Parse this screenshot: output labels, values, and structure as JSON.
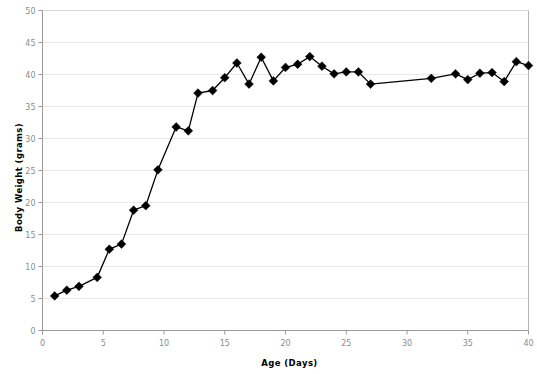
{
  "chart_data": {
    "type": "line",
    "title": "",
    "subtitle": "",
    "xlabel": "Age  (Days)",
    "ylabel": "Body Weight  (grams)",
    "xlim": [
      0,
      40
    ],
    "ylim": [
      0,
      50
    ],
    "xticks": [
      0,
      5,
      10,
      15,
      20,
      25,
      30,
      35,
      40
    ],
    "xtick_labels": [
      "0",
      "5",
      "10",
      "15",
      "20",
      "25",
      "30",
      "35",
      "40"
    ],
    "yticks": [
      0,
      5,
      10,
      15,
      20,
      25,
      30,
      35,
      40,
      45,
      50
    ],
    "ytick_labels": [
      "0",
      "5",
      "10",
      "15",
      "20",
      "25",
      "30",
      "35",
      "40",
      "45",
      "50"
    ],
    "grid": true,
    "grid_axis": "y",
    "grid_color": "#e8e8e8",
    "legend": false,
    "legend_position": "none",
    "marker": "diamond",
    "marker_color": "#000000",
    "line_color": "#000000",
    "line_width": 1.3,
    "marker_size": 4.4,
    "series": [
      {
        "name": "Body Weight",
        "x": [
          1,
          2,
          3,
          4.5,
          5.5,
          6.5,
          7.5,
          8.5,
          9.5,
          11,
          12,
          12.8,
          14,
          15,
          16,
          17,
          18,
          19,
          20,
          21,
          22,
          23,
          24,
          25,
          26,
          27,
          32,
          34,
          35,
          36,
          37,
          38,
          39,
          40
        ],
        "y": [
          5.4,
          6.3,
          6.9,
          8.3,
          12.7,
          13.5,
          18.8,
          19.5,
          25.1,
          31.8,
          31.2,
          37.1,
          37.5,
          39.5,
          41.8,
          38.5,
          42.7,
          39.0,
          41.1,
          41.6,
          42.8,
          41.3,
          40.1,
          40.4,
          40.4,
          38.5,
          39.4,
          40.1,
          39.2,
          40.2,
          40.3,
          38.9,
          42.0,
          41.4
        ]
      }
    ],
    "annotations": []
  },
  "axes": {
    "x_title": "Age  (Days)",
    "y_title": "Body Weight  (grams)"
  }
}
